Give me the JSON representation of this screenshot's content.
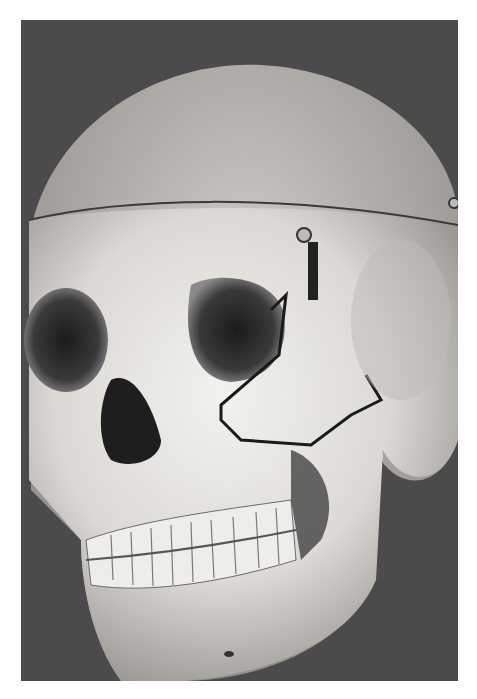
{
  "image": {
    "description": "Black-and-white photograph of a human skull model, front three-quarter view, with a calvarium cut line, a metal spring hinge at the temple, and dark lines marking fractures around the orbit and zygoma",
    "alt": "Skull with marked orbital and zygomatic fracture lines",
    "colors": {
      "background": "#4a4a4a",
      "bone": "#e8e6e2",
      "shadow": "#2a2a2a",
      "frame": "#ffffff"
    }
  }
}
